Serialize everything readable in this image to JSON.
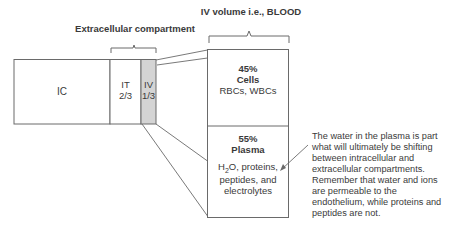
{
  "labels": {
    "extracellular_title": "Extracellular compartment",
    "blood_title": "IV volume i.e., BLOOD"
  },
  "compartments": {
    "ic": {
      "label": "IC"
    },
    "it": {
      "label": "IT",
      "fraction": "2/3"
    },
    "iv": {
      "label": "IV",
      "fraction": "1/3"
    }
  },
  "blood": {
    "cells": {
      "percent": "45%",
      "title": "Cells",
      "desc": "RBCs, WBCs"
    },
    "plasma": {
      "percent": "55%",
      "title": "Plasma",
      "desc_pre": "H",
      "desc_sub": "2",
      "desc_post": "O, proteins,",
      "desc_line2": "peptides, and",
      "desc_line3": "electrolytes"
    }
  },
  "note": "The water in the plasma is part what will ultimately be shifting between intracellular and extracellular compartments. Remember that water and ions are permeable to the endothelium, while proteins and peptides are not.",
  "colors": {
    "line": "#6a6a6a",
    "iv_fill": "#d4d4d4"
  }
}
